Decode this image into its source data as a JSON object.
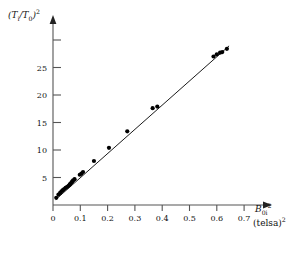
{
  "figure": {
    "background_color": "#ffffff",
    "ink_color": "#111111",
    "marker_color": "#000000",
    "axis_color": "#555555"
  },
  "axes": {
    "y_label_html": "(<i>T</i><sub>i</sub>/<i>T</i><sub>0</sub>)<sup>2</sup>",
    "y_label_plain": "(Ti/T0)2",
    "x_label_plain": "B0i2",
    "x_units_plain": "(telsa)2",
    "x_ticks": [
      "0",
      "0.1",
      "0.2",
      "0.3",
      "0.4",
      "0.5",
      "0.6",
      "0.7"
    ],
    "y_ticks": [
      "5",
      "10",
      "15",
      "20",
      "25"
    ]
  },
  "chart_data": {
    "type": "scatter",
    "title": "",
    "subtitle": "",
    "xlabel": "B0i^2 (telsa)^2",
    "ylabel": "(Ti/T0)^2",
    "xlim": [
      0,
      0.73
    ],
    "ylim": [
      0,
      31
    ],
    "grid": false,
    "legend": "none",
    "x_tick_values": [
      0,
      0.1,
      0.2,
      0.3,
      0.4,
      0.5,
      0.6,
      0.7
    ],
    "x_tick_labels": [
      "0",
      "0.1",
      "0.2",
      "0.3",
      "0.4",
      "0.5",
      "0.6",
      "0.7"
    ],
    "y_tick_values": [
      5,
      10,
      15,
      20,
      25,
      30
    ],
    "y_tick_labels": [
      "5",
      "10",
      "15",
      "20",
      "25",
      ""
    ],
    "axis_style": "arrow-ended L-axes, ticks outward, no frame",
    "series": [
      {
        "name": "measurements",
        "marker": "filled-circle",
        "marker_color": "#000000",
        "marker_size_px": 4.2,
        "x": [
          0.012,
          0.02,
          0.026,
          0.031,
          0.036,
          0.041,
          0.046,
          0.052,
          0.057,
          0.061,
          0.064,
          0.068,
          0.071,
          0.074,
          0.079,
          0.098,
          0.104,
          0.11,
          0.15,
          0.205,
          0.272,
          0.365,
          0.382,
          0.588,
          0.6,
          0.612,
          0.62,
          0.637
        ],
        "y": [
          1.3,
          1.9,
          2.2,
          2.5,
          2.7,
          2.9,
          3.1,
          3.3,
          3.5,
          3.7,
          3.9,
          4.1,
          4.3,
          4.5,
          4.7,
          5.5,
          5.7,
          6.0,
          8.0,
          10.4,
          13.4,
          17.6,
          17.9,
          27.0,
          27.4,
          27.7,
          27.8,
          28.4
        ]
      }
    ],
    "fit_line": {
      "type": "line",
      "name": "linear fit",
      "color": "#000000",
      "width_px": 0.9,
      "slope": 44.0,
      "intercept": 0.55,
      "x_start": 0.01,
      "x_end": 0.645,
      "y_start": 0.99,
      "y_end": 28.93
    }
  }
}
